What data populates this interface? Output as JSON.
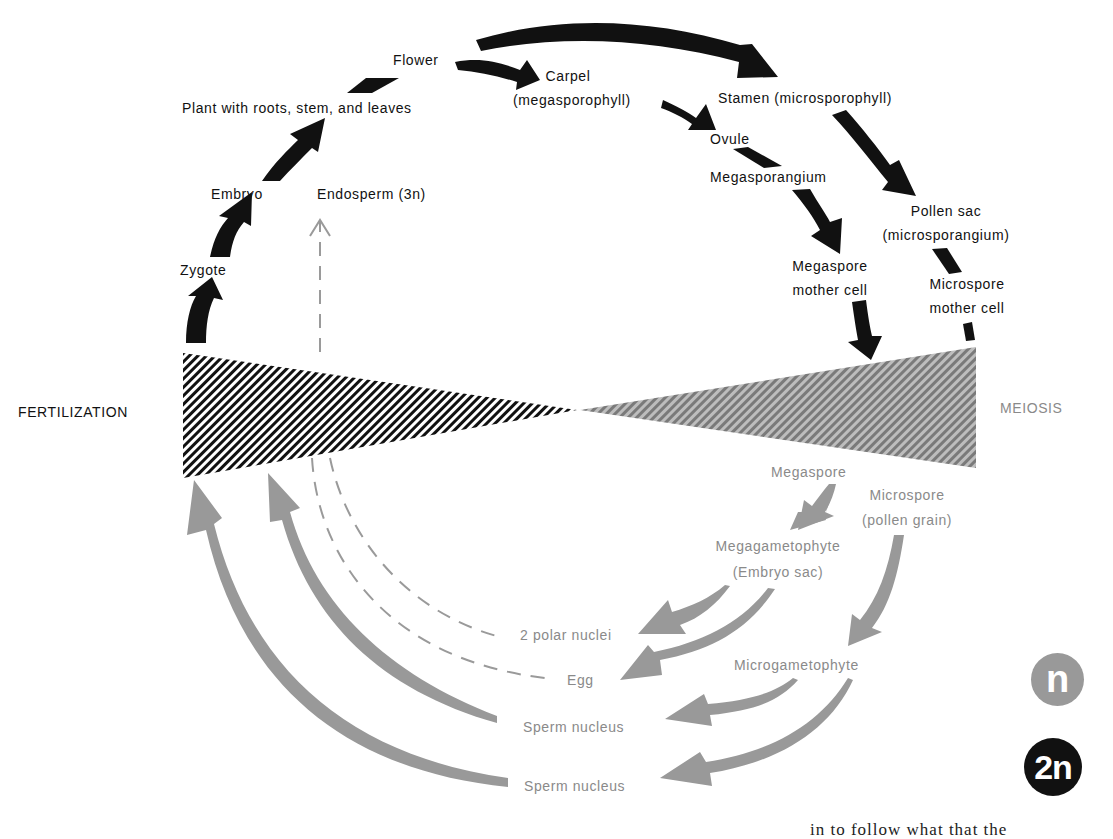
{
  "diagram": {
    "colors": {
      "diploid": "#111111",
      "haploid": "#999999",
      "haploid_text": "#8a8a8a",
      "endosperm_line": "#9a9a9a",
      "background": "#ffffff"
    },
    "events": {
      "fertilization": "FERTILIZATION",
      "meiosis": "MEIOSIS"
    },
    "diploid_phase": {
      "labels": {
        "zygote": "Zygote",
        "embryo": "Embryo",
        "endosperm": "Endosperm (3n)",
        "plant": "Plant with roots, stem, and leaves",
        "flower": "Flower",
        "carpel_line1": "Carpel",
        "carpel_line2": "(megasporophyll)",
        "stamen": "Stamen (microsporophyll)",
        "ovule": "Ovule",
        "megasporangium": "Megasporangium",
        "pollen_sac_line1": "Pollen sac",
        "pollen_sac_line2": "(microsporangium)",
        "megaspore_mother_line1": "Megaspore",
        "megaspore_mother_line2": "mother cell",
        "microspore_mother_line1": "Microspore",
        "microspore_mother_line2": "mother cell"
      }
    },
    "haploid_phase": {
      "labels": {
        "megaspore": "Megaspore",
        "microspore_line1": "Microspore",
        "microspore_line2": "(pollen grain)",
        "megagametophyte_line1": "Megagametophyte",
        "megagametophyte_line2": "(Embryo sac)",
        "polar_nuclei": "2 polar nuclei",
        "egg": "Egg",
        "microgametophyte": "Microgametophyte",
        "sperm_nucleus_1": "Sperm nucleus",
        "sperm_nucleus_2": "Sperm nucleus"
      }
    },
    "legend": {
      "haploid": "n",
      "diploid": "2n"
    },
    "footer_fragment": "in to follow what that the"
  }
}
